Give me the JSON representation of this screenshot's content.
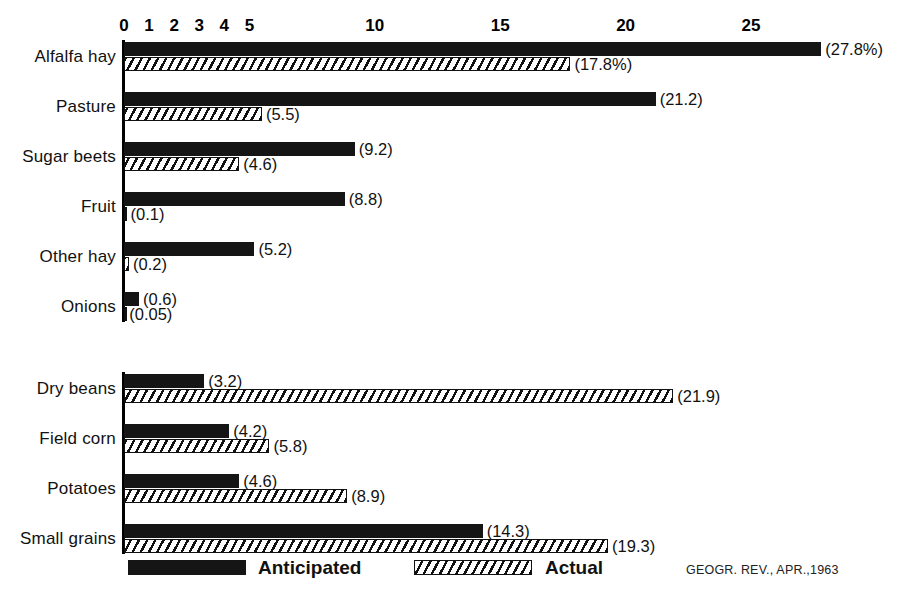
{
  "chart_data": {
    "type": "bar",
    "orientation": "horizontal",
    "title": "",
    "subtitle": "",
    "xlabel": "",
    "ylabel": "",
    "xlim": [
      0,
      28.5
    ],
    "grid": false,
    "legend_position": "bottom",
    "tick_labels": [
      "0",
      "1",
      "2",
      "3",
      "4",
      "5",
      "10",
      "15",
      "20",
      "25"
    ],
    "tick_values": [
      0,
      1,
      2,
      3,
      4,
      5,
      10,
      15,
      20,
      25
    ],
    "categories": [
      "Alfalfa hay",
      "Pasture",
      "Sugar beets",
      "Fruit",
      "Other hay",
      "Onions",
      "Dry beans",
      "Field corn",
      "Potatoes",
      "Small grains"
    ],
    "series": [
      {
        "name": "Anticipated",
        "color": "#151515",
        "values": [
          27.8,
          21.2,
          9.2,
          8.8,
          5.2,
          0.6,
          3.2,
          4.2,
          4.6,
          14.3
        ],
        "value_labels": [
          "(27.8%)",
          "(21.2)",
          "(9.2)",
          "(8.8)",
          "(5.2)",
          "(0.6)",
          "(3.2)",
          "(4.2)",
          "(4.6)",
          "(14.3)"
        ]
      },
      {
        "name": "Actual",
        "color": "#ffffff",
        "values": [
          17.8,
          5.5,
          4.6,
          0.1,
          0.2,
          0.05,
          21.9,
          5.8,
          8.9,
          19.3
        ],
        "value_labels": [
          "(17.8%)",
          "(5.5)",
          "(4.6)",
          "(0.1)",
          "(0.2)",
          "(0.05)",
          "(21.9)",
          "(5.8)",
          "(8.9)",
          "(19.3)"
        ]
      }
    ],
    "group_break_after_index": 5
  },
  "legend": {
    "anticipated_label": "Anticipated",
    "actual_label": "Actual"
  },
  "footer": {
    "source_credit": "GEOGR. REV., APR.,1963"
  }
}
